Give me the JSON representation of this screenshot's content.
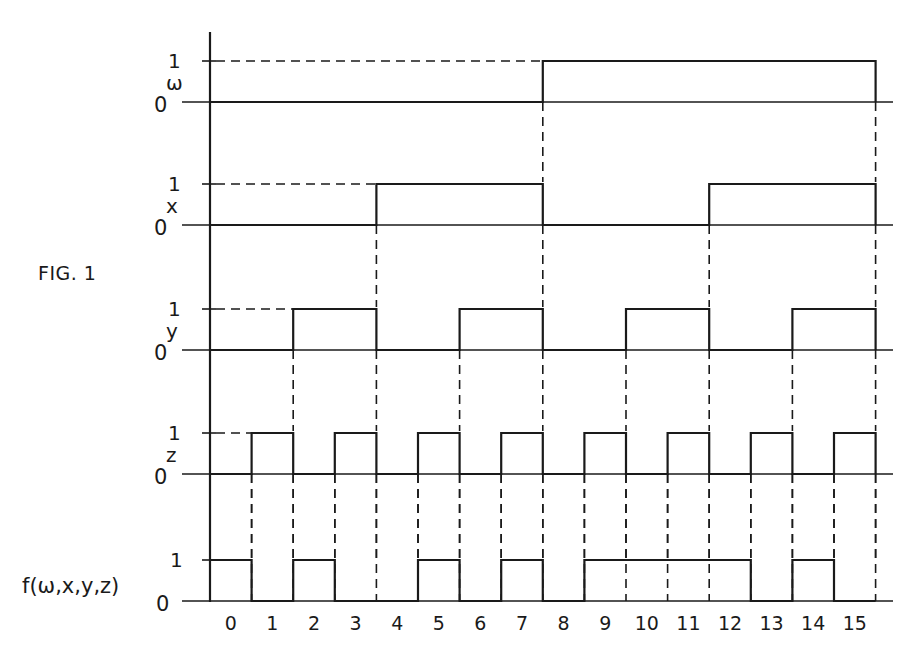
{
  "figure": {
    "label": "FIG. 1",
    "ink_color": "#1a1a1a",
    "background": "#ffffff"
  },
  "chart_data": {
    "type": "timing-diagram",
    "title": "FIG. 1",
    "xlabel": "",
    "x_ticks": [
      "0",
      "1",
      "2",
      "3",
      "4",
      "5",
      "6",
      "7",
      "8",
      "9",
      "10",
      "11",
      "12",
      "13",
      "14",
      "15"
    ],
    "level_labels": {
      "high": "1",
      "low": "0"
    },
    "series": [
      {
        "name": "w",
        "label": "ω",
        "values": [
          0,
          0,
          0,
          0,
          0,
          0,
          0,
          0,
          1,
          1,
          1,
          1,
          1,
          1,
          1,
          1
        ]
      },
      {
        "name": "x",
        "label": "x",
        "values": [
          0,
          0,
          0,
          0,
          1,
          1,
          1,
          1,
          0,
          0,
          0,
          0,
          1,
          1,
          1,
          1
        ]
      },
      {
        "name": "y",
        "label": "y",
        "values": [
          0,
          0,
          1,
          1,
          0,
          0,
          1,
          1,
          0,
          0,
          1,
          1,
          0,
          0,
          1,
          1
        ]
      },
      {
        "name": "z",
        "label": "z",
        "values": [
          0,
          1,
          0,
          1,
          0,
          1,
          0,
          1,
          0,
          1,
          0,
          1,
          0,
          1,
          0,
          1
        ]
      },
      {
        "name": "f",
        "label": "f(ω,x,y,z)",
        "values": [
          1,
          0,
          1,
          0,
          0,
          1,
          0,
          1,
          0,
          1,
          1,
          1,
          1,
          0,
          1,
          0
        ]
      }
    ]
  },
  "layout": {
    "axis_x": 210,
    "axis_top": 32,
    "axis_bottom": 602,
    "slot_width": 41.6,
    "baseline_end": 893,
    "rows": [
      {
        "high": 61,
        "low": 102
      },
      {
        "high": 184,
        "low": 225
      },
      {
        "high": 309,
        "low": 350
      },
      {
        "high": 433,
        "low": 474
      },
      {
        "high": 560,
        "low": 601
      }
    ],
    "tick_label_y": 630
  }
}
